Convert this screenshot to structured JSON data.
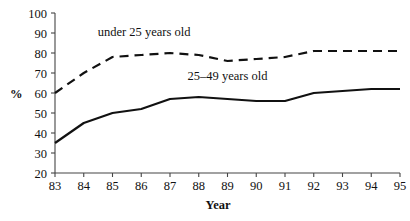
{
  "chart_data": {
    "type": "line",
    "title": "",
    "subtitle": "",
    "xlabel": "Year",
    "ylabel": "%",
    "x": [
      83,
      84,
      85,
      86,
      87,
      88,
      89,
      90,
      91,
      92,
      93,
      94,
      95
    ],
    "xticklabels": [
      "83",
      "84",
      "85",
      "86",
      "87",
      "88",
      "89",
      "90",
      "91",
      "92",
      "93",
      "94",
      "95"
    ],
    "yticklabels": [
      "20",
      "30",
      "40",
      "50",
      "60",
      "70",
      "80",
      "90",
      "100"
    ],
    "yticks": [
      20,
      30,
      40,
      50,
      60,
      70,
      80,
      90,
      100
    ],
    "xlim": [
      83,
      95
    ],
    "ylim": [
      20,
      100
    ],
    "grid": false,
    "legend": "inline-annotations",
    "series": [
      {
        "name": "under 25 years old",
        "style": "dashed",
        "color": "#111111",
        "values": [
          60,
          70,
          78,
          79,
          80,
          79,
          76,
          77,
          78,
          81,
          81,
          81,
          81
        ]
      },
      {
        "name": "25–49 years old",
        "style": "solid",
        "color": "#111111",
        "values": [
          35,
          45,
          50,
          52,
          57,
          58,
          57,
          56,
          56,
          60,
          61,
          62,
          62
        ]
      }
    ],
    "annotations": [
      {
        "text": "under 25 years old",
        "x": 86.1,
        "y": 88.5
      },
      {
        "text": "25–49 years old",
        "x": 89.0,
        "y": 66.5
      }
    ]
  },
  "axis": {
    "y_title": "%",
    "x_title": "Year"
  }
}
